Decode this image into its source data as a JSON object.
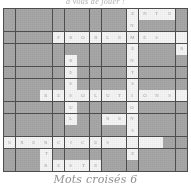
{
  "document": {
    "type": "crossword-puzzle-scan",
    "top_caption": "à  vous  de  jouer  !",
    "bottom_caption": "Mots croisés 6"
  },
  "colors": {
    "page_background": "#ffffff",
    "blocked_cell": "#a9a9a9",
    "open_cell": "#fbfbfb",
    "grid_line": "#4c4c4c",
    "letter_ink": "#6f6f6f",
    "caption_ink": "#7b7b7b"
  },
  "grid": {
    "columns": 15,
    "rows": 14,
    "cell_width_px": 12.3,
    "cell_height_px": 11.7,
    "legend": {
      "1": "open white lettered cell",
      "0": "blocked gray cell"
    },
    "mask": [
      [
        0,
        0,
        0,
        0,
        0,
        0,
        0,
        0,
        0,
        0,
        1,
        1,
        1,
        1,
        0
      ],
      [
        0,
        0,
        0,
        0,
        0,
        0,
        0,
        0,
        0,
        0,
        1,
        0,
        0,
        0,
        0
      ],
      [
        0,
        0,
        0,
        0,
        1,
        1,
        1,
        1,
        1,
        1,
        1,
        1,
        1,
        1,
        1
      ],
      [
        0,
        0,
        0,
        0,
        0,
        0,
        0,
        0,
        0,
        0,
        1,
        0,
        0,
        0,
        1
      ],
      [
        0,
        0,
        0,
        0,
        0,
        1,
        0,
        0,
        0,
        0,
        1,
        0,
        0,
        0,
        0
      ],
      [
        0,
        0,
        0,
        0,
        0,
        1,
        0,
        0,
        0,
        0,
        1,
        0,
        0,
        0,
        0
      ],
      [
        0,
        0,
        0,
        0,
        0,
        1,
        0,
        0,
        0,
        0,
        1,
        0,
        0,
        0,
        0
      ],
      [
        0,
        0,
        0,
        1,
        1,
        1,
        1,
        1,
        1,
        1,
        1,
        1,
        1,
        1,
        1
      ],
      [
        0,
        0,
        0,
        0,
        0,
        1,
        0,
        0,
        0,
        0,
        1,
        0,
        0,
        0,
        0
      ],
      [
        0,
        0,
        0,
        0,
        0,
        1,
        0,
        0,
        1,
        1,
        1,
        0,
        0,
        0,
        0
      ],
      [
        0,
        0,
        0,
        0,
        0,
        0,
        0,
        0,
        0,
        0,
        1,
        0,
        0,
        0,
        0
      ],
      [
        1,
        1,
        1,
        1,
        1,
        1,
        1,
        1,
        1,
        1,
        1,
        1,
        1,
        0,
        0
      ],
      [
        0,
        0,
        0,
        1,
        0,
        0,
        0,
        0,
        0,
        0,
        1,
        0,
        0,
        0,
        0
      ],
      [
        0,
        0,
        0,
        1,
        1,
        1,
        1,
        1,
        0,
        0,
        0,
        0,
        0,
        0,
        0
      ]
    ],
    "letters": [
      [
        "",
        "",
        "",
        "",
        "",
        "",
        "",
        "",
        "",
        "",
        "E",
        "N",
        "T",
        "E",
        ""
      ],
      [
        "",
        "",
        "",
        "",
        "",
        "",
        "",
        "",
        "",
        "",
        "N",
        "",
        "",
        "",
        ""
      ],
      [
        "",
        "",
        "",
        "",
        "P",
        "R",
        "O",
        "B",
        "L",
        "E",
        "M",
        "E",
        "S",
        "",
        ""
      ],
      [
        "",
        "",
        "",
        "",
        "",
        "",
        "",
        "",
        "",
        "",
        "E",
        "",
        "",
        "",
        "R"
      ],
      [
        "",
        "",
        "",
        "",
        "",
        "R",
        "",
        "",
        "",
        "",
        "N",
        "",
        "",
        "",
        ""
      ],
      [
        "",
        "",
        "",
        "",
        "",
        "E",
        "",
        "",
        "",
        "",
        "T",
        "",
        "",
        "",
        ""
      ],
      [
        "",
        "",
        "",
        "",
        "",
        "S",
        "",
        "",
        "",
        "",
        "S",
        "",
        "",
        "",
        ""
      ],
      [
        "",
        "",
        "",
        "R",
        "E",
        "S",
        "O",
        "L",
        "U",
        "T",
        "I",
        "O",
        "N",
        "S",
        ""
      ],
      [
        "",
        "",
        "",
        "",
        "",
        "U",
        "",
        "",
        "",
        "",
        "O",
        "",
        "",
        "",
        ""
      ],
      [
        "",
        "",
        "",
        "",
        "",
        "L",
        "",
        "",
        "R",
        "E",
        "N",
        "",
        "",
        "",
        ""
      ],
      [
        "",
        "",
        "",
        "",
        "",
        "",
        "",
        "",
        "",
        "",
        "S",
        "",
        "",
        "",
        ""
      ],
      [
        "E",
        "X",
        "E",
        "R",
        "C",
        "I",
        "C",
        "E",
        "S",
        "",
        "",
        "",
        "",
        "",
        ""
      ],
      [
        "",
        "",
        "",
        "T",
        "",
        "",
        "",
        "",
        "",
        "",
        "E",
        "",
        "",
        "",
        ""
      ],
      [
        "",
        "",
        "",
        "R",
        "E",
        "S",
        "T",
        "E",
        "",
        "",
        "",
        "",
        "",
        "",
        ""
      ]
    ]
  }
}
